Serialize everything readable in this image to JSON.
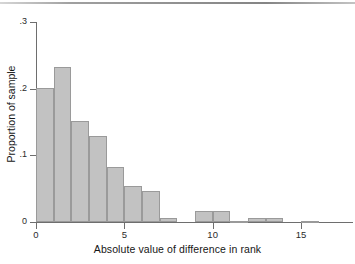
{
  "figure": {
    "kind": "histogram-figure",
    "background": "#ffffff",
    "bar_fill": "#c2c2c2",
    "bar_stroke": "#9a9a9a",
    "axis_color": "#6e6e6e"
  },
  "axes": {
    "x_title": "Absolute value of difference in rank",
    "y_title": "Proportion of sample",
    "x_ticks": [
      "0",
      "5",
      "10",
      "15"
    ],
    "y_ticks": [
      ".3",
      ".2",
      ".1",
      "0"
    ]
  },
  "chart_data": {
    "type": "bar",
    "title": "",
    "xlabel": "Absolute value of difference in rank",
    "ylabel": "Proportion of sample",
    "xlim": [
      0,
      16
    ],
    "ylim": [
      0,
      0.3
    ],
    "xticks": [
      0,
      5,
      10,
      15
    ],
    "yticks": [
      0,
      0.1,
      0.2,
      0.3
    ],
    "ytick_labels": [
      "0",
      ".1",
      ".2",
      ".3"
    ],
    "xtick_labels": [
      "0",
      "5",
      "10",
      "15"
    ],
    "grid": false,
    "legend": false,
    "bin_width": 1,
    "categories": [
      "0-1",
      "1-2",
      "2-3",
      "3-4",
      "4-5",
      "5-6",
      "6-7",
      "7-8",
      "8-9",
      "9-10",
      "10-11",
      "11-12",
      "12-13",
      "13-14",
      "14-15",
      "15-16"
    ],
    "bin_starts": [
      0,
      1,
      2,
      3,
      4,
      5,
      6,
      7,
      8,
      9,
      10,
      11,
      12,
      13,
      14,
      15
    ],
    "values": [
      0.201,
      0.233,
      0.152,
      0.129,
      0.082,
      0.054,
      0.047,
      0.006,
      0.0,
      0.016,
      0.016,
      0.002,
      0.006,
      0.006,
      0.0,
      0.002
    ]
  }
}
